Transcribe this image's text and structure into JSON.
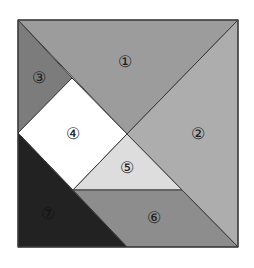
{
  "diagram": {
    "type": "tangram",
    "square": {
      "left": 18,
      "top": 20,
      "right": 238,
      "bottom": 247
    },
    "pieces": [
      {
        "id": "1",
        "label": "①",
        "shape": "large-triangle",
        "color": "#9c9c9c",
        "points": "18,20 238,20 127,134",
        "label_pos": {
          "x": 125,
          "y": 62
        }
      },
      {
        "id": "2",
        "label": "②",
        "shape": "large-triangle",
        "color": "#adadad",
        "points": "238,20 238,247 127,134",
        "label_pos": {
          "x": 198,
          "y": 134
        }
      },
      {
        "id": "3",
        "label": "③",
        "shape": "small-triangle",
        "color": "#7c7c7c",
        "points": "18,20 72,78 18,133",
        "label_pos": {
          "x": 39,
          "y": 78
        }
      },
      {
        "id": "4",
        "label": "④",
        "shape": "square",
        "color": "#ffffff",
        "points": "72,78 127,134 73,190 18,133",
        "label_pos": {
          "x": 73,
          "y": 134
        }
      },
      {
        "id": "5",
        "label": "⑤",
        "shape": "small-triangle",
        "color": "#dddddd",
        "points": "127,134 182,190 73,190",
        "label_pos": {
          "x": 127,
          "y": 168
        }
      },
      {
        "id": "6",
        "label": "⑥",
        "shape": "parallelogram",
        "color": "#8d8d8d",
        "points": "73,190 182,190 238,247 127,247",
        "label_pos": {
          "x": 154,
          "y": 218
        }
      },
      {
        "id": "7",
        "label": "⑦",
        "shape": "medium-triangle",
        "color": "#222222",
        "points": "18,133 127,247 18,247",
        "label_pos": {
          "x": 48,
          "y": 214
        }
      }
    ],
    "outline_color": "#3a3a3a"
  }
}
